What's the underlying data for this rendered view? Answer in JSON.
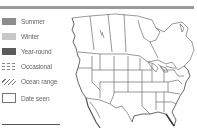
{
  "legend": {
    "items": [
      {
        "label": "Summer",
        "swatch": "summer",
        "color": "#8c8c8c"
      },
      {
        "label": "Winter",
        "swatch": "winter",
        "color": "#c8c8c8"
      },
      {
        "label": "Year-round",
        "swatch": "yearround",
        "color": "#5a5a5a"
      },
      {
        "label": "Occasional",
        "swatch": "occasional",
        "color": "#888888"
      },
      {
        "label": "Ocean range",
        "swatch": "ocean",
        "color": "#777777"
      },
      {
        "label": "Date seen",
        "swatch": "date",
        "color": "#ffffff"
      }
    ]
  },
  "map": {
    "region": "North America",
    "style": "outline",
    "line_color": "#555555"
  },
  "colors": {
    "top_bar": "#9a9a9a",
    "divider": "#555555"
  }
}
